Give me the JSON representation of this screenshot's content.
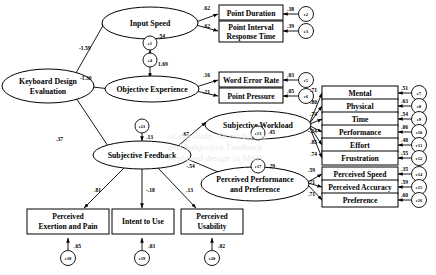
{
  "diagram": {
    "type": "sem-path-diagram",
    "latents": {
      "keyboard_design_evaluation": "Keyboard Design\nEvaluation",
      "keyboard_design_evaluation_l1": "Keyboard Design",
      "keyboard_design_evaluation_l2": "Evaluation",
      "input_speed": "Input Speed",
      "objective_experience": "Objective Experience",
      "subjective_feedback": "Subjective Feedback",
      "subjective_workload": "Subjective Workload",
      "perceived_performance_l1": "Perceived Performance",
      "perceived_performance_l2": "and Preference"
    },
    "indicators": {
      "point_duration": "Point Duration",
      "point_interval_l1": "Point Interval",
      "point_interval_l2": "Response Time",
      "word_error_rate": "Word Error Rate",
      "point_pressure": "Point Pressure",
      "mental": "Mental",
      "physical": "Physical",
      "time": "Time",
      "performance": "Performance",
      "effort": "Effort",
      "frustration": "Frustration",
      "perceived_speed": "Perceived Speed",
      "perceived_accuracy": "Perceived Accuracy",
      "preference": "Preference",
      "perceived_exertion_l1": "Perceived",
      "perceived_exertion_l2": "Exertion and Pain",
      "intent_to_use": "Intent to Use",
      "perceived_usability_l1": "Perceived",
      "perceived_usability_l2": "Usability"
    },
    "errors": {
      "e1": "e1",
      "e2": "e2",
      "e3": "e3",
      "e4": "e4",
      "e5": "e5",
      "e6": "e6",
      "e7": "e7",
      "e8": "e8",
      "e9": "e9",
      "e10": "e10",
      "e11": "e11",
      "e12": "e12",
      "e13": "e13",
      "e14": "e14",
      "e15": "e15",
      "e16": "e16",
      "e17": "e17",
      "e18": "e18",
      "e19": "e19",
      "e20": "e20",
      "e21": "e21"
    },
    "structural_paths": {
      "kde_to_input_speed": "-1.59",
      "kde_to_objective_experience": "-1.30",
      "kde_to_subjective_feedback": ".37",
      "subjective_feedback_to_workload": ".67",
      "subjective_feedback_to_performance": "-.54",
      "input_speed_residual": ".54",
      "objective_experience_residual": "1.69",
      "subjective_feedback_residual": ".13",
      "workload_residual": ".45",
      "performance_residual": ".29",
      "sf_to_exertion": ".81",
      "sf_to_intent": "-.18",
      "sf_to_usability": ".13"
    },
    "loadings": {
      "point_duration": ".62",
      "point_interval": ".62",
      "word_error_rate": ".16",
      "point_pressure": ".21",
      "mental": ".71",
      "physical": ".80",
      "time": ".74",
      "performance": "-.24",
      "effort": ".85",
      "frustration": ".74",
      "perceived_speed": ".59",
      "perceived_accuracy": ".71",
      "preference": ".71"
    },
    "error_variances": {
      "e2": ".38",
      "e3": ".39",
      "e5": ".03",
      "e6": ".05",
      "e7": ".51",
      "e8": ".63",
      "e9": ".54",
      "e10": ".06",
      "e11": ".48",
      "e12": ".55",
      "e14": ".35",
      "e15": ".59",
      "e16": ".60",
      "e18": ".65",
      "e19": ".03",
      "e20": ".02"
    },
    "background_watermark": {
      "l1": "of the study. To model the",
      "l2": "and Subjective Feedback",
      "l3": "keyboard design in MSD",
      "l4": "the other",
      "l5": "support",
      "l6": "reduces"
    }
  }
}
